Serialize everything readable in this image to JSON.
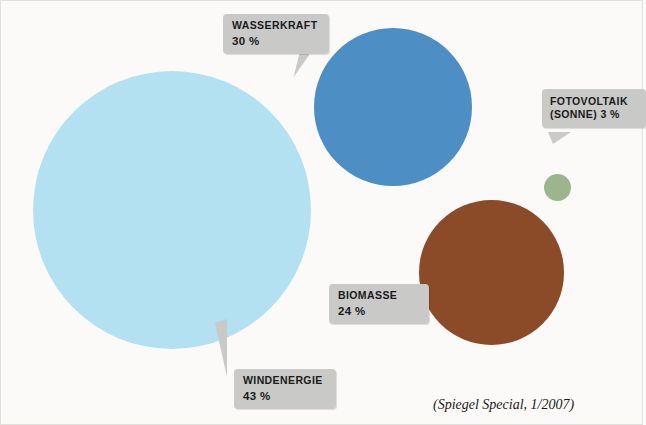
{
  "chart_data": {
    "type": "pie",
    "title": "",
    "subtitle": "",
    "xlabel": "",
    "ylabel": "",
    "legend_position": "none",
    "grid": false,
    "unit": "%",
    "categories": [
      "Windenergie",
      "Wasserkraft",
      "Biomasse",
      "Fotovoltaik (Sonne)"
    ],
    "values": [
      43,
      30,
      24,
      3
    ],
    "series": [
      {
        "name": "Anteil",
        "values": [
          43,
          30,
          24,
          3
        ]
      }
    ],
    "slices": [
      {
        "label": "WINDENERGIE",
        "value_text": "43 %",
        "value": 43,
        "color": "#b3e1f2"
      },
      {
        "label": "WASSERKRAFT",
        "value_text": "30 %",
        "value": 30,
        "color": "#4d8fc4"
      },
      {
        "label": "BIOMASSE",
        "value_text": "24 %",
        "value": 24,
        "color": "#8b4a28"
      },
      {
        "label_line1": "FOTOVOLTAIK",
        "label_line2": "(SONNE)",
        "value_text": "3 %",
        "value": 3,
        "color": "#9cb58c"
      }
    ],
    "annotations": [
      "(Spiegel Special, 1/2007)"
    ]
  },
  "source_note": "(Spiegel Special, 1/2007)",
  "callouts": {
    "wasserkraft": {
      "name": "WASSERKRAFT",
      "value": "30 %"
    },
    "fotovoltaik": {
      "name_line1": "FOTOVOLTAIK",
      "name_line2": "(SONNE)",
      "value": "3 %"
    },
    "biomasse": {
      "name": "BIOMASSE",
      "value": "24 %"
    },
    "windenergie": {
      "name": "WINDENERGIE",
      "value": "43 %"
    }
  },
  "colors": {
    "wind": "#b3e1f2",
    "wasser": "#4d8fc4",
    "biomasse": "#8b4a28",
    "fotovoltaik": "#9cb58c",
    "callout_bg": "#c9c9c7",
    "background": "#fbfaf8"
  }
}
